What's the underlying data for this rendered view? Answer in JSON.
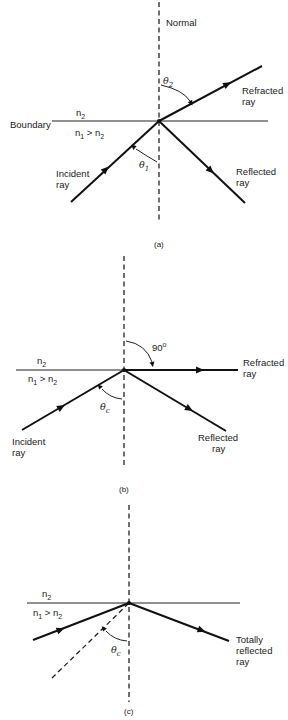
{
  "panels": [
    {
      "id": "a",
      "caption": "(a)",
      "labels": {
        "normal": "Normal",
        "boundary": "Boundary",
        "n2": "n",
        "n2_sub": "2",
        "n1": "n",
        "n1_sub": "1",
        "gt": " > n",
        "gt_sub": "2",
        "theta2": "θ",
        "theta2_sub": "2",
        "theta1": "θ",
        "theta1_sub": "1",
        "refracted_line1": "Refracted",
        "refracted_line2": "ray",
        "reflected_line1": "Reflected",
        "reflected_line2": "ray",
        "incident_line1": "Incident",
        "incident_line2": "ray"
      }
    },
    {
      "id": "b",
      "caption": "(b)",
      "labels": {
        "n2": "n",
        "n2_sub": "2",
        "n1": "n",
        "n1_sub": "1",
        "gt": " > n",
        "gt_sub": "2",
        "angle90": "90",
        "degree": "o",
        "thetac": "θ",
        "thetac_sub": "c",
        "refracted_line1": "Refracted",
        "refracted_line2": "ray",
        "reflected_line1": "Reflected",
        "reflected_line2": "ray",
        "incident_line1": "Incident",
        "incident_line2": "ray"
      }
    },
    {
      "id": "c",
      "caption": "(c)",
      "labels": {
        "n2": "n",
        "n2_sub": "2",
        "n1": "n",
        "n1_sub": "1",
        "gt": " > n",
        "gt_sub": "2",
        "thetac": "θ",
        "thetac_sub": "c",
        "reflected_line1": "Totally",
        "reflected_line2": "reflected",
        "reflected_line3": "ray"
      }
    }
  ]
}
